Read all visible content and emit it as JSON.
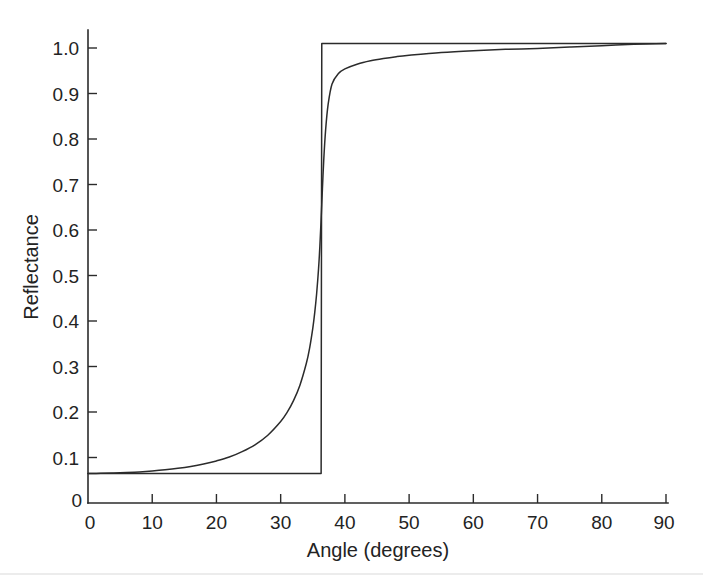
{
  "chart_data": {
    "type": "line",
    "title": "",
    "subtitle": "",
    "xlabel": "Angle (degrees)",
    "ylabel": "Reflectance",
    "xlim": [
      0,
      90
    ],
    "ylim": [
      0,
      1.05
    ],
    "grid": false,
    "legend": "none",
    "x_ticks": [
      0,
      10,
      20,
      30,
      40,
      50,
      60,
      70,
      80,
      90
    ],
    "x_tick_labels": [
      "0",
      "10",
      "20",
      "30",
      "40",
      "50",
      "60",
      "70",
      "80",
      "90"
    ],
    "y_ticks": [
      0,
      0.1,
      0.2,
      0.3,
      0.4,
      0.5,
      0.6,
      0.7,
      0.8,
      0.9,
      1.0
    ],
    "y_tick_labels": [
      "0",
      "0.1",
      "0.2",
      "0.3",
      "0.4",
      "0.5",
      "0.6",
      "0.7",
      "0.8",
      "0.9",
      "1.0"
    ],
    "critical_angle": 36.4,
    "plateau_value": 1.01,
    "series": [
      {
        "name": "ideal-total-internal-reflection",
        "color": "#2b2b2b",
        "x": [
          0,
          36.3,
          36.4,
          40,
          50,
          60,
          70,
          80,
          90
        ],
        "values": [
          0.065,
          0.065,
          1.01,
          1.01,
          1.01,
          1.01,
          1.01,
          1.01,
          1.01
        ]
      },
      {
        "name": "smooth-reflectance",
        "color": "#2b2b2b",
        "x": [
          0,
          2,
          4,
          6,
          8,
          10,
          12,
          14,
          16,
          18,
          20,
          22,
          24,
          26,
          28,
          30,
          31,
          32,
          33,
          34,
          34.5,
          35,
          35.3,
          35.6,
          35.9,
          36.1,
          36.3,
          36.5,
          36.7,
          37,
          37.4,
          38,
          39,
          40,
          42,
          44,
          46,
          48,
          50,
          55,
          60,
          65,
          70,
          75,
          80,
          85,
          90
        ],
        "values": [
          0.065,
          0.0652,
          0.0658,
          0.0668,
          0.0683,
          0.0703,
          0.0729,
          0.0762,
          0.0804,
          0.0857,
          0.0925,
          0.101,
          0.113,
          0.128,
          0.149,
          0.179,
          0.199,
          0.225,
          0.259,
          0.307,
          0.34,
          0.384,
          0.418,
          0.46,
          0.515,
          0.563,
          0.624,
          0.69,
          0.752,
          0.82,
          0.877,
          0.921,
          0.944,
          0.954,
          0.965,
          0.972,
          0.977,
          0.981,
          0.984,
          0.99,
          0.994,
          0.997,
          0.999,
          1.002,
          1.005,
          1.008,
          1.01
        ]
      }
    ]
  },
  "figure": {
    "background_color": "#ffffff",
    "line_color": "#2b2b2b",
    "text_color": "#232323"
  }
}
